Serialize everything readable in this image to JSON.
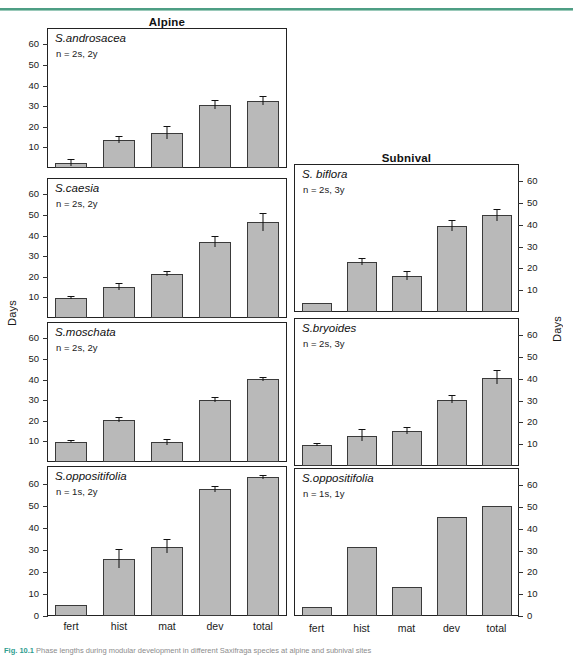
{
  "figure": {
    "column_titles": {
      "left": "Alpine",
      "right": "Subnival"
    },
    "y_axis_label_left": "Days",
    "y_axis_label_right": "Days",
    "x_categories": [
      "fert",
      "hist",
      "mat",
      "dev",
      "total"
    ],
    "caption_number": "Fig. 10.1",
    "caption_text": "Phase lengths during modular development in different Saxifraga species at alpine and subnival sites"
  },
  "chart_data": {
    "type": "bar",
    "title": "Phase lengths during modular development in different Saxifraga species",
    "xlabel": "",
    "ylabel": "Days",
    "ylim": [
      0,
      68
    ],
    "yticks": [
      0,
      10,
      20,
      30,
      40,
      50,
      60
    ],
    "grid": false,
    "legend": "none",
    "categories": [
      "fert",
      "hist",
      "mat",
      "dev",
      "total"
    ],
    "panels": [
      {
        "column": "Alpine",
        "species": "S.androsacea",
        "n": "n = 2s, 2y",
        "values": [
          2.5,
          13.5,
          17.0,
          30.5,
          32.5
        ],
        "errors": [
          1.5,
          1.5,
          3.0,
          2.0,
          2.0
        ],
        "y_ticklabels": [
          "10",
          "20",
          "30",
          "40",
          "50",
          "60"
        ],
        "axis_side": "left"
      },
      {
        "column": "Alpine",
        "species": "S.caesia",
        "n": "n = 2s, 2y",
        "values": [
          9.5,
          15.0,
          21.5,
          37.0,
          46.5
        ],
        "errors": [
          0.5,
          1.5,
          1.0,
          2.5,
          4.0
        ],
        "y_ticklabels": [
          "10",
          "20",
          "30",
          "40",
          "50",
          "60"
        ],
        "axis_side": "left"
      },
      {
        "column": "Alpine",
        "species": "S.moschata",
        "n": "n = 2s, 2y",
        "values": [
          9.8,
          20.3,
          9.7,
          30.2,
          40.1
        ],
        "errors": [
          0.3,
          1.0,
          1.2,
          1.0,
          0.8
        ],
        "y_ticklabels": [
          "10",
          "20",
          "30",
          "40",
          "50",
          "60"
        ],
        "axis_side": "left"
      },
      {
        "column": "Alpine",
        "species": "S.oppositifolia",
        "n": "n = 1s, 2y",
        "values": [
          4.8,
          25.8,
          31.5,
          57.5,
          62.8
        ],
        "errors": [
          0.0,
          4.0,
          3.0,
          1.2,
          0.8
        ],
        "y_ticklabels": [
          "0",
          "10",
          "20",
          "30",
          "40",
          "50",
          "60"
        ],
        "axis_side": "left"
      },
      {
        "column": "Subnival",
        "species": "S. biflora",
        "n": "n = 2s, 3y",
        "values": [
          4.0,
          23.0,
          16.5,
          39.5,
          44.5
        ],
        "errors": [
          0.0,
          1.5,
          2.0,
          2.5,
          2.5
        ],
        "y_ticklabels": [
          "10",
          "20",
          "30",
          "40",
          "50",
          "60"
        ],
        "axis_side": "right"
      },
      {
        "column": "Subnival",
        "species": "S.bryoides",
        "n": "n = 2s, 3y",
        "values": [
          9.8,
          14.0,
          16.0,
          30.5,
          40.5
        ],
        "errors": [
          0.5,
          2.5,
          1.5,
          1.5,
          3.0
        ],
        "y_ticklabels": [
          "10",
          "20",
          "30",
          "40",
          "50",
          "60"
        ],
        "axis_side": "right"
      },
      {
        "column": "Subnival",
        "species": "S.oppositifolia",
        "n": "n = 1s, 1y",
        "values": [
          4.0,
          31.5,
          13.5,
          45.5,
          50.5
        ],
        "errors": [
          0.0,
          0.0,
          0.0,
          0.0,
          0.0
        ],
        "y_ticklabels": [
          "0",
          "10",
          "20",
          "30",
          "40",
          "50",
          "60"
        ],
        "axis_side": "right"
      }
    ]
  },
  "colors": {
    "bar_fill": "#b9b9b9",
    "bar_stroke": "#3a3a3a",
    "axis": "#222222",
    "rule_green": "#4e9e84",
    "caption_accent": "#2f9e8f"
  }
}
